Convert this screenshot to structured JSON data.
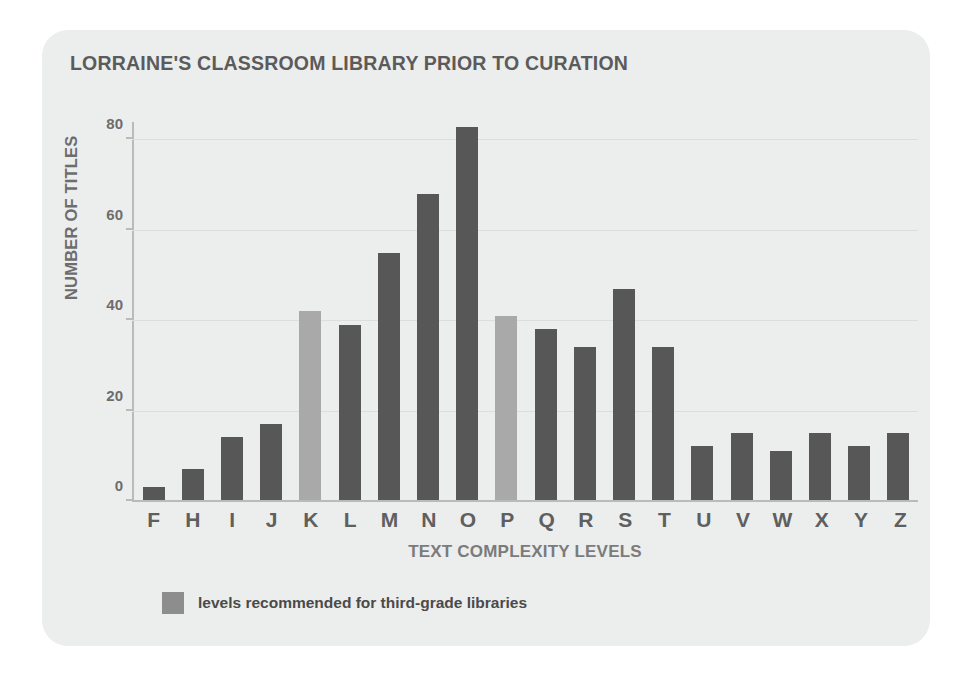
{
  "chart_data": {
    "type": "bar",
    "title": "LORRAINE'S CLASSROOM LIBRARY PRIOR TO CURATION",
    "xlabel": "TEXT COMPLEXITY LEVELS",
    "ylabel": "NUMBER OF TITLES",
    "ylim": [
      0,
      84
    ],
    "yticks": [
      0,
      20,
      40,
      60,
      80
    ],
    "grid": true,
    "legend_position": "bottom-left",
    "categories": [
      "F",
      "H",
      "I",
      "J",
      "K",
      "L",
      "M",
      "N",
      "O",
      "P",
      "Q",
      "R",
      "S",
      "T",
      "U",
      "V",
      "W",
      "X",
      "Y",
      "Z"
    ],
    "values": [
      3,
      7,
      14,
      17,
      42,
      39,
      55,
      68,
      83,
      41,
      38,
      34,
      47,
      34,
      12,
      15,
      11,
      15,
      12,
      15
    ],
    "highlighted": [
      "K",
      "P"
    ],
    "series": [
      {
        "name": "levels recommended for third-grade libraries",
        "values": [
          3,
          7,
          14,
          17,
          42,
          39,
          55,
          68,
          83,
          41,
          38,
          34,
          47,
          34,
          12,
          15,
          11,
          15,
          12,
          15
        ]
      }
    ],
    "legend": [
      {
        "label": "levels recommended for third-grade libraries",
        "color": "#8d8d8d"
      }
    ],
    "colors": {
      "bar_default": "#575757",
      "bar_highlight": "#a9a9a9",
      "card_background": "#eceded",
      "page_background": "#ffffff",
      "grid": "#dcdddd",
      "axis": "#b9bbbb",
      "title_text": "#5b5b5b",
      "tick_text": "#6d6d6d"
    }
  }
}
